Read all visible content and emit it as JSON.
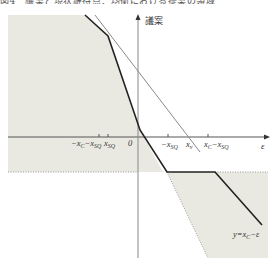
{
  "caption": "図4　議案と現状維持点：均衡における提案の領域",
  "axes": {
    "y_label": "議案",
    "x_label": "ε",
    "origin_label": "0"
  },
  "x_ticks": [
    {
      "label": "−x_C−x_SQ",
      "main": "−x",
      "sub1": "C",
      "mid": "−x",
      "sub2": "SQ"
    },
    {
      "label": "x_SQ",
      "main": "x",
      "sub": "SQ"
    },
    {
      "label": "0"
    },
    {
      "label": "−x_SQ",
      "main": "−x",
      "sub": "SQ"
    },
    {
      "label": "x_v",
      "main": "x",
      "sub": "v"
    },
    {
      "label": "x_C−x_SQ",
      "main": "x",
      "sub1": "C",
      "mid": "−x",
      "sub2": "SQ"
    }
  ],
  "annotation": {
    "label": "y=x_C−ε",
    "prefix": "y=x",
    "sub": "C",
    "suffix": "−ε"
  },
  "colors": {
    "shade": "#e9e9e1",
    "thick_line": "#222222",
    "thin_line": "#8a8a8a",
    "axis": "#555555"
  }
}
